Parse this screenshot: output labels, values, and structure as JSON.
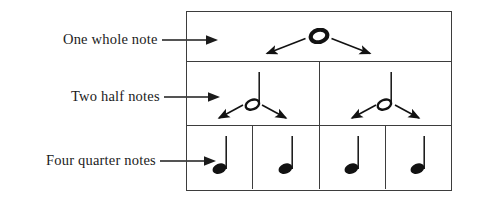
{
  "diagram": {
    "ink_color": "#1b1b1b",
    "rule_color": "#3d3d3d",
    "background": "#ffffff"
  },
  "labels": [
    {
      "id": "whole",
      "text": "One whole note",
      "arrow_icon": "arrow-right-icon"
    },
    {
      "id": "half",
      "text": "Two half notes",
      "arrow_icon": "arrow-right-icon"
    },
    {
      "id": "quarter",
      "text": "Four quarter notes",
      "arrow_icon": "arrow-right-icon"
    }
  ],
  "rows": [
    {
      "id": "whole",
      "label_ref": "One whole note",
      "note_type": "whole-note",
      "note_symbol": "whole note",
      "count": 1,
      "cells": 1
    },
    {
      "id": "half",
      "label_ref": "Two half notes",
      "note_type": "half-note",
      "note_symbol": "half note",
      "count": 2,
      "cells": 2
    },
    {
      "id": "quarter",
      "label_ref": "Four quarter notes",
      "note_type": "quarter-note",
      "note_symbol": "quarter note",
      "count": 4,
      "cells": 4
    }
  ],
  "branch_arrows": [
    {
      "id": "whole-to-half-left",
      "from": "whole-note",
      "to": "half-note-1",
      "direction": "down-left"
    },
    {
      "id": "whole-to-half-right",
      "from": "whole-note",
      "to": "half-note-2",
      "direction": "down-right"
    },
    {
      "id": "half1-to-quarter-left",
      "from": "half-note-1",
      "to": "quarter-note-1",
      "direction": "down-left"
    },
    {
      "id": "half1-to-quarter-right",
      "from": "half-note-1",
      "to": "quarter-note-2",
      "direction": "down-right"
    },
    {
      "id": "half2-to-quarter-left",
      "from": "half-note-2",
      "to": "quarter-note-3",
      "direction": "down-left"
    },
    {
      "id": "half2-to-quarter-right",
      "from": "half-note-2",
      "to": "quarter-note-4",
      "direction": "down-right"
    }
  ]
}
